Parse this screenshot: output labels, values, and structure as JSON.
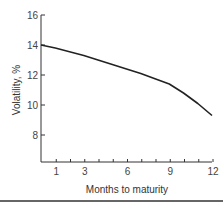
{
  "chart_data": {
    "type": "line",
    "title": "",
    "xlabel": "Months to maturity",
    "ylabel": "Volatility, %",
    "xlim": [
      0,
      12
    ],
    "ylim": [
      6,
      16
    ],
    "x_ticks": [
      1,
      3,
      6,
      9,
      12
    ],
    "x_minor_ticks": [
      1,
      2,
      3,
      4,
      5,
      6,
      7,
      8,
      9,
      10,
      11,
      12
    ],
    "y_ticks": [
      8,
      10,
      12,
      14,
      16
    ],
    "grid": false,
    "legend": null,
    "series": [
      {
        "name": "Volatility term structure",
        "color": "#222222",
        "x": [
          0,
          1,
          2,
          3,
          4,
          5,
          6,
          7,
          8,
          9,
          10,
          11,
          12
        ],
        "y": [
          14.0,
          13.8,
          13.55,
          13.3,
          13.0,
          12.7,
          12.4,
          12.1,
          11.75,
          11.4,
          10.8,
          10.1,
          9.3
        ]
      }
    ]
  }
}
